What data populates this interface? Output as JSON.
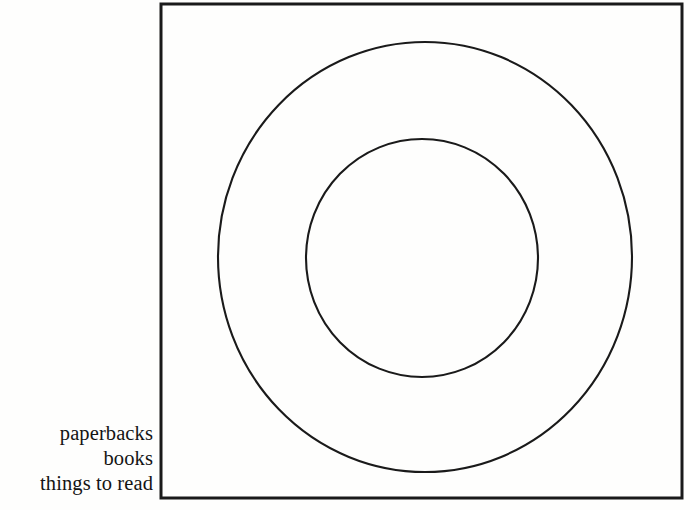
{
  "figure": {
    "type": "euler-diagram",
    "background_color": "#fefefd",
    "ink_color": "#1a1a1a",
    "frame": {
      "name": "universe-box",
      "shape": "square",
      "x": 161,
      "y": 4,
      "width": 521,
      "height": 494,
      "stroke_width": 3
    },
    "shapes": [
      {
        "name": "outer-circle",
        "shape": "circle",
        "cx": 425,
        "cy": 257,
        "rx": 207,
        "ry": 215,
        "stroke_width": 2.1,
        "fill": "none"
      },
      {
        "name": "inner-circle",
        "shape": "circle",
        "cx": 422,
        "cy": 258,
        "rx": 116,
        "ry": 119,
        "stroke_width": 2.1,
        "fill": "none"
      }
    ],
    "labels": [
      {
        "text": "paperbacks",
        "refers_to": "inner-circle"
      },
      {
        "text": "books",
        "refers_to": "outer-circle"
      },
      {
        "text": "things to read",
        "refers_to": "universe-box"
      }
    ]
  },
  "chart_data": {
    "type": "diagram",
    "title": "",
    "nesting": [
      "things to read",
      "books",
      "paperbacks"
    ],
    "regions": [
      {
        "label": "things to read",
        "shape": "square",
        "level": 0
      },
      {
        "label": "books",
        "shape": "circle",
        "level": 1
      },
      {
        "label": "paperbacks",
        "shape": "circle",
        "level": 2
      }
    ]
  }
}
